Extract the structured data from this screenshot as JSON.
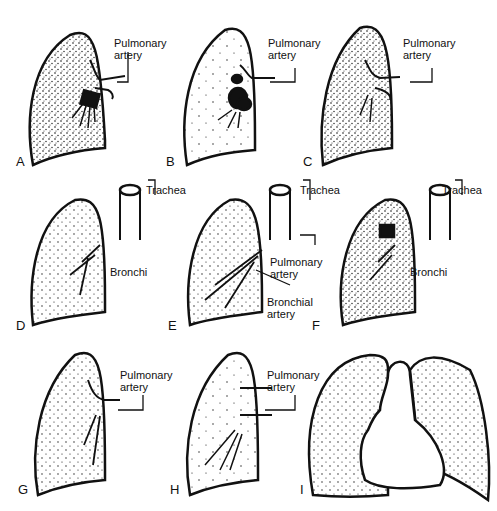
{
  "figure": {
    "panels": [
      {
        "id": "A",
        "letter": "A",
        "labels": [
          "Pulmonary",
          "artery"
        ]
      },
      {
        "id": "B",
        "letter": "B",
        "labels": [
          "Pulmonary",
          "artery"
        ]
      },
      {
        "id": "C",
        "letter": "C",
        "labels": [
          "Pulmonary",
          "artery"
        ]
      },
      {
        "id": "D",
        "letter": "D",
        "labels": [
          "Trachea",
          "Bronchi"
        ]
      },
      {
        "id": "E",
        "letter": "E",
        "labels": [
          "Trachea",
          "Pulmonary",
          "artery",
          "Bronchial",
          "artery"
        ]
      },
      {
        "id": "F",
        "letter": "F",
        "labels": [
          "Trachea",
          "Bronchi"
        ]
      },
      {
        "id": "G",
        "letter": "G",
        "labels": [
          "Pulmonary",
          "artery"
        ]
      },
      {
        "id": "H",
        "letter": "H",
        "labels": [
          "Pulmonary",
          "artery"
        ]
      },
      {
        "id": "I",
        "letter": "I",
        "labels": []
      }
    ],
    "colors": {
      "ink": "#111111",
      "background": "#ffffff"
    }
  }
}
